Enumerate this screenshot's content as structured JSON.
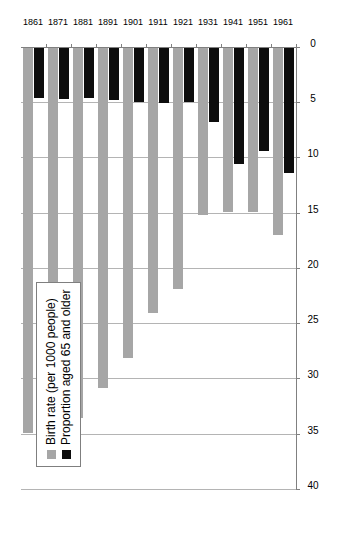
{
  "chart_data": {
    "type": "bar",
    "orientation": "horizontal-rotated",
    "title": "",
    "xlabel": "",
    "ylabel": "",
    "categories": [
      "1861",
      "1871",
      "1881",
      "1891",
      "1901",
      "1911",
      "1921",
      "1931",
      "1941",
      "1951",
      "1961"
    ],
    "series": [
      {
        "name": "Birth rate (per 1000 people)",
        "color": "#a6a6a6",
        "values": [
          34.8,
          35.0,
          33.5,
          30.8,
          28.1,
          24.0,
          21.8,
          15.1,
          14.8,
          14.8,
          16.9
        ]
      },
      {
        "name": "Proportion aged 65 and older",
        "color": "#0d0d0d",
        "values": [
          4.5,
          4.6,
          4.5,
          4.7,
          4.9,
          5.0,
          4.9,
          6.7,
          10.5,
          9.3,
          11.3
        ]
      }
    ],
    "value_axis": {
      "min": 0,
      "max": 40,
      "ticks": [
        0,
        5,
        10,
        15,
        20,
        25,
        30,
        35,
        40
      ],
      "tick_labels": [
        "0",
        "5",
        "10",
        "15",
        "20",
        "25",
        "30",
        "35",
        "40"
      ],
      "grid": true,
      "reversed": true
    },
    "legend": {
      "position": "upper-left",
      "border_color": "#7f7f7f",
      "entries": [
        {
          "label": "Birth rate (per 1000 people)",
          "swatch": "legend-swatch-gray",
          "color": "#a6a6a6"
        },
        {
          "label": "Proportion aged 65 and older",
          "swatch": "legend-swatch-black",
          "color": "#0d0d0d"
        }
      ]
    },
    "colors": {
      "series_1": "#a6a6a6",
      "series_2": "#0d0d0d",
      "gridline": "#b4b4b4",
      "axis": "#808080",
      "background": "#ffffff"
    }
  }
}
